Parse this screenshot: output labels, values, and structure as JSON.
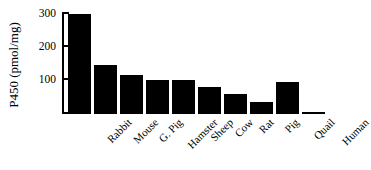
{
  "chart_data": {
    "type": "bar",
    "title": "",
    "xlabel": "",
    "ylabel": "P450 (pmol/mg)",
    "categories": [
      "Rabbit",
      "Mouse",
      "G. Pig",
      "Hamster",
      "Sheep",
      "Cow",
      "Rat",
      "Pig",
      "Quail",
      "Human"
    ],
    "values": [
      305,
      148,
      120,
      102,
      102,
      83,
      60,
      35,
      98,
      5
    ],
    "ylim": [
      0,
      310
    ],
    "yticks": [
      100,
      200,
      300
    ],
    "ytick_labels": [
      "100",
      "200",
      "300"
    ],
    "grid": false,
    "legend": false,
    "bar_color": "#000000",
    "background_color": "#ffffff",
    "axis_color": "#000000"
  },
  "axis": {
    "y_title": "P450 (pmol/mg)",
    "tick_300": "300",
    "tick_200": "200",
    "tick_100": "100"
  }
}
